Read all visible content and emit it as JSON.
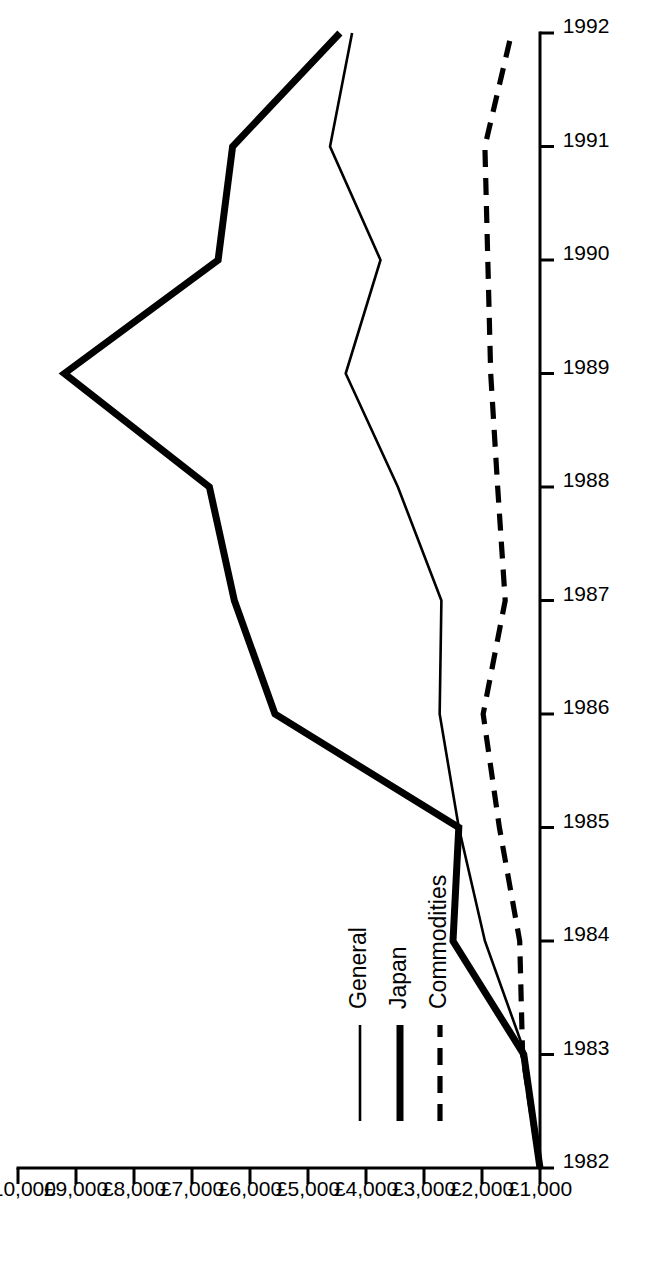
{
  "chart_data": {
    "type": "line",
    "title": "",
    "subtitle": "",
    "xlabel": "",
    "ylabel": "",
    "orientation": "rotated-90-ccw",
    "grid": false,
    "legend_position": "bottom-left",
    "x": [
      1982,
      1983,
      1984,
      1985,
      1986,
      1987,
      1988,
      1989,
      1990,
      1991,
      1992
    ],
    "x_tick_labels": [
      "1982",
      "1983",
      "1984",
      "1985",
      "1986",
      "1987",
      "1988",
      "1989",
      "1990",
      "1991",
      "1992"
    ],
    "xlim": [
      1982,
      1992
    ],
    "y_tick_labels": [
      "£1,000",
      "£2,000",
      "£3,000",
      "£4,000",
      "£5,000",
      "£6,000",
      "£7,000",
      "£8,000",
      "£9,000",
      "£10,000"
    ],
    "y_tick_values": [
      1000,
      2000,
      3000,
      4000,
      5000,
      6000,
      7000,
      8000,
      9000,
      10000
    ],
    "ylim": [
      1000,
      10000
    ],
    "series": [
      {
        "name": "General",
        "style": "solid-thin",
        "values": [
          1000,
          1250,
          1950,
          2400,
          2730,
          2700,
          3450,
          4350,
          3750,
          4620,
          4240
        ]
      },
      {
        "name": "Japan",
        "style": "solid-thick",
        "values": [
          1000,
          1280,
          2500,
          2400,
          5570,
          6270,
          6700,
          9200,
          6550,
          6300,
          4450
        ]
      },
      {
        "name": "Commodities",
        "style": "dashed",
        "values": [
          1000,
          1300,
          1350,
          1700,
          1980,
          1600,
          1730,
          1850,
          1900,
          1950,
          1490
        ]
      }
    ]
  },
  "legend": {
    "items": [
      {
        "label": "General",
        "icon": "solid-thin-line-icon"
      },
      {
        "label": "Japan",
        "icon": "solid-thick-line-icon"
      },
      {
        "label": "Commodities",
        "icon": "dashed-line-icon"
      }
    ]
  }
}
